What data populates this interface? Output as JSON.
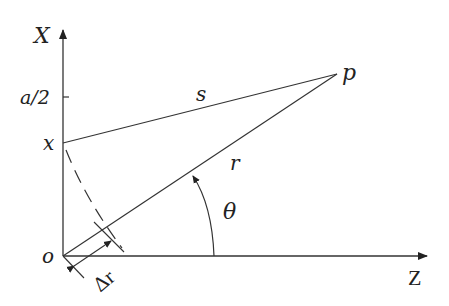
{
  "diagram": {
    "axes": {
      "vertical_label": "X",
      "horizontal_label": "Z",
      "origin_label": "o"
    },
    "points": {
      "x_point_label": "x",
      "a_half_tick_label": "a/2",
      "p_label": "p"
    },
    "segments": {
      "s_label": "s",
      "r_label": "r"
    },
    "angle_label": "θ",
    "delta_r_label": "Δr",
    "colors": {
      "line": "#333333",
      "text": "#222222",
      "background": "#ffffff"
    }
  }
}
